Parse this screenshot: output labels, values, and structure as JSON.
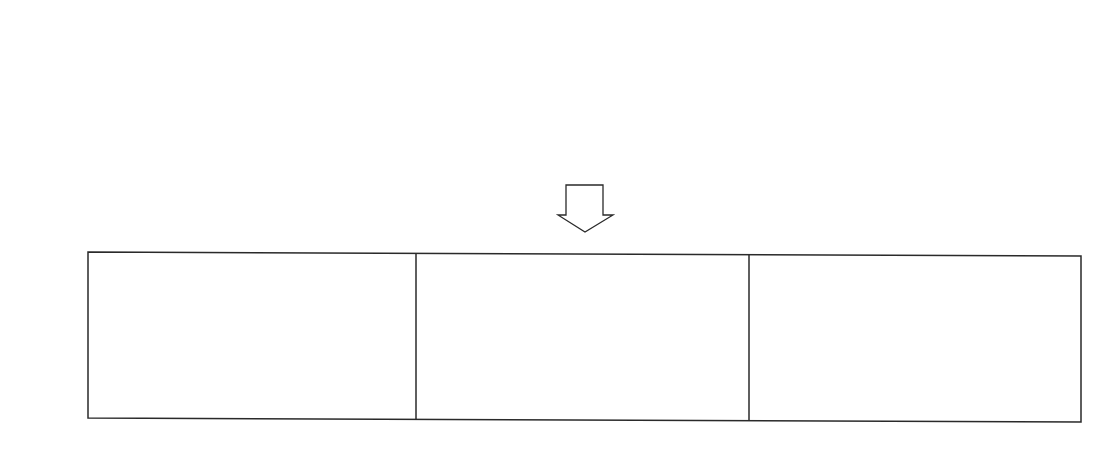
{
  "panel_label": "(b)",
  "colors": {
    "fill": "#c6c6c6",
    "stroke": "#2a2a2a",
    "background": "#ffffff"
  },
  "top_row": {
    "description": "Five whole circles each divided into three equal sectors",
    "items": [
      {
        "id": "circle-1",
        "cx": 219,
        "cy": 99,
        "r": 55,
        "sectors": 3
      },
      {
        "id": "circle-2",
        "cx": 400,
        "cy": 100,
        "r": 55,
        "sectors": 3
      },
      {
        "id": "circle-3",
        "cx": 584,
        "cy": 101,
        "r": 55,
        "sectors": 3
      },
      {
        "id": "circle-4",
        "cx": 768,
        "cy": 102,
        "r": 55,
        "sectors": 3
      },
      {
        "id": "circle-5",
        "cx": 950,
        "cy": 102,
        "r": 55,
        "sectors": 3
      }
    ]
  },
  "arrow": {
    "direction": "down",
    "icon": "hollow-down-arrow-icon"
  },
  "groups": {
    "description": "Three boxed groups, each with one whole circle (3/3) and one circle missing one third (2/3)",
    "items": [
      {
        "whole": {
          "cx": 181,
          "cy": 339,
          "r": 55
        },
        "partial": {
          "cx": 329,
          "cy": 340,
          "r": 56,
          "sectors_shown": 2
        }
      },
      {
        "whole": {
          "cx": 509,
          "cy": 342,
          "r": 55
        },
        "partial": {
          "cx": 659,
          "cy": 343,
          "r": 55,
          "sectors_shown": 2
        }
      },
      {
        "whole": {
          "cx": 840,
          "cy": 345,
          "r": 55
        },
        "partial": {
          "cx": 990,
          "cy": 345,
          "r": 55,
          "sectors_shown": 2
        }
      }
    ]
  }
}
